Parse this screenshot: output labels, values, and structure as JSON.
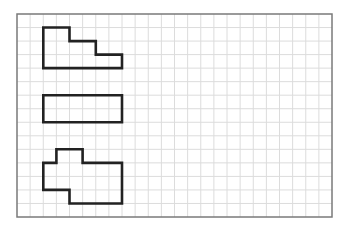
{
  "figure": {
    "grid": {
      "columns": 24,
      "rows": 15,
      "line_color": "#dcdcdc",
      "border_color": "#7a7a7a"
    },
    "shape_color": "#222222",
    "shapes": [
      {
        "name": "staircase-shape",
        "points": [
          [
            2,
            1
          ],
          [
            4,
            1
          ],
          [
            4,
            2
          ],
          [
            6,
            2
          ],
          [
            6,
            3
          ],
          [
            8,
            3
          ],
          [
            8,
            4
          ],
          [
            2,
            4
          ]
        ]
      },
      {
        "name": "rectangle-shape",
        "points": [
          [
            2,
            6
          ],
          [
            8,
            6
          ],
          [
            8,
            8
          ],
          [
            2,
            8
          ]
        ]
      },
      {
        "name": "irregular-shape",
        "points": [
          [
            3,
            10
          ],
          [
            5,
            10
          ],
          [
            5,
            11
          ],
          [
            8,
            11
          ],
          [
            8,
            14
          ],
          [
            4,
            14
          ],
          [
            4,
            13
          ],
          [
            2,
            13
          ],
          [
            2,
            11
          ],
          [
            3,
            11
          ]
        ]
      }
    ]
  }
}
